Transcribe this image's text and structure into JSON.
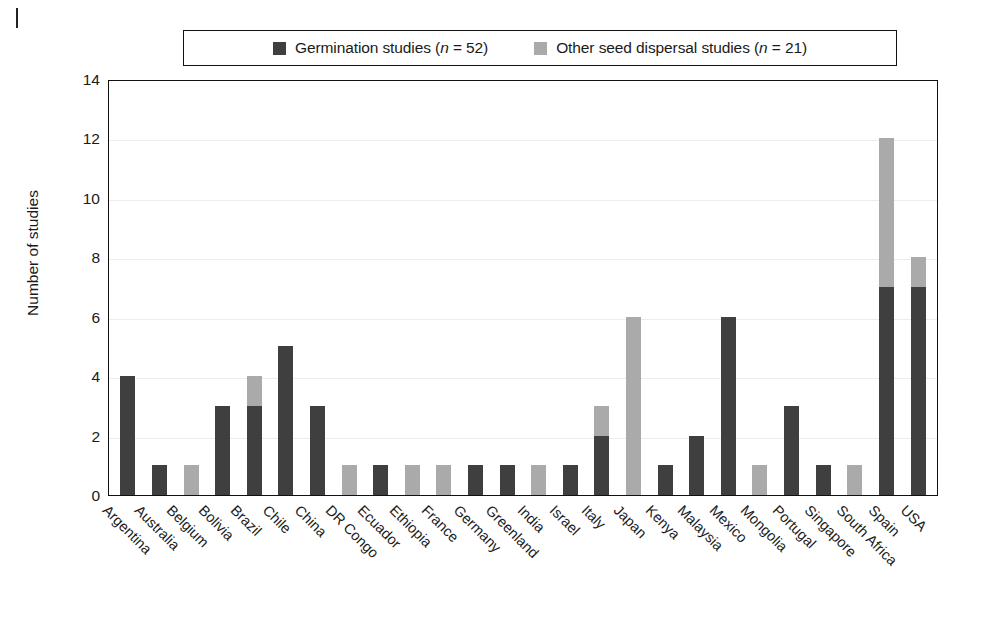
{
  "figure": {
    "ylabel": "Number of studies",
    "legend": {
      "items": [
        {
          "label_prefix": "Germination studies (",
          "label_italic": "n",
          "label_suffix": " = 52)",
          "color": "#3f3f3f",
          "swatch_icon": "square-swatch-dark"
        },
        {
          "label_prefix": "Other seed dispersal studies (",
          "label_italic": "n",
          "label_suffix": " = 21)",
          "color": "#aaaaaa",
          "swatch_icon": "square-swatch-light"
        }
      ]
    }
  },
  "chart_data": {
    "type": "bar",
    "subtype": "stacked-vertical",
    "title": "",
    "xlabel": "",
    "ylabel": "Number of studies",
    "ylim": [
      0,
      14
    ],
    "yticks": [
      0,
      2,
      4,
      6,
      8,
      10,
      12,
      14
    ],
    "grid": "horizontal-light",
    "legend_position": "top-center-boxed",
    "colors": {
      "germination": "#3f3f3f",
      "other_dispersal": "#aaaaaa",
      "frame": "#111111",
      "gridline": "#ededed",
      "background": "#ffffff"
    },
    "categories": [
      "Argentina",
      "Australia",
      "Belgium",
      "Bolivia",
      "Brazil",
      "Chile",
      "China",
      "DR Congo",
      "Ecuador",
      "Ethiopia",
      "France",
      "Germany",
      "Greenland",
      "India",
      "Israel",
      "Italy",
      "Japan",
      "Kenya",
      "Malaysia",
      "Mexico",
      "Mongolia",
      "Portugal",
      "Singapore",
      "South Africa",
      "Spain",
      "USA"
    ],
    "series": [
      {
        "name": "Germination studies (n = 52)",
        "key": "germination",
        "color": "#3f3f3f",
        "n": 52,
        "values": [
          4,
          1,
          0,
          3,
          3,
          5,
          3,
          0,
          1,
          0,
          0,
          1,
          1,
          0,
          1,
          2,
          0,
          1,
          2,
          6,
          0,
          3,
          1,
          0,
          7,
          7
        ]
      },
      {
        "name": "Other seed dispersal studies (n = 21)",
        "key": "other_dispersal",
        "color": "#aaaaaa",
        "n": 21,
        "values": [
          0,
          0,
          1,
          0,
          1,
          0,
          0,
          1,
          0,
          1,
          1,
          0,
          0,
          1,
          0,
          1,
          6,
          0,
          0,
          0,
          1,
          0,
          0,
          1,
          5,
          1
        ]
      }
    ],
    "totals": [
      4,
      1,
      1,
      3,
      4,
      5,
      3,
      1,
      1,
      1,
      1,
      1,
      1,
      1,
      1,
      3,
      6,
      1,
      2,
      6,
      1,
      3,
      1,
      1,
      12,
      8
    ]
  }
}
